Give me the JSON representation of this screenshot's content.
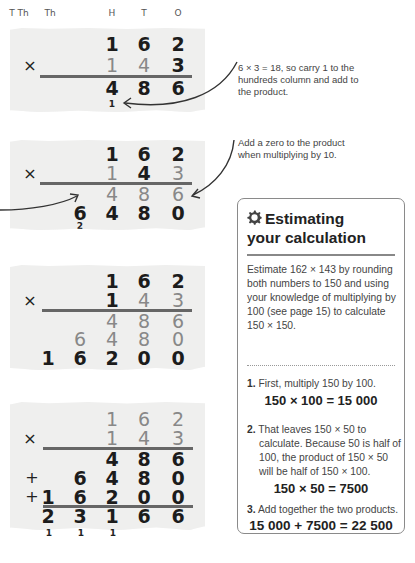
{
  "column_headers": [
    "T Th",
    "Th",
    "H",
    "T",
    "O"
  ],
  "panel1": {
    "rows": [
      {
        "sym": "",
        "digits": [
          "",
          "",
          "1",
          "6",
          "2"
        ]
      },
      {
        "sym": "×",
        "digits": [
          "",
          "",
          "1",
          "4",
          "3"
        ]
      },
      {
        "sym": "",
        "digits": [
          "",
          "",
          "4",
          "8",
          "6"
        ]
      }
    ],
    "carry": "1",
    "note": "6 × 3 = 18, so carry 1 to the hundreds column and add to the product."
  },
  "panel2": {
    "rows": [
      {
        "sym": "",
        "digits": [
          "",
          "",
          "1",
          "6",
          "2"
        ]
      },
      {
        "sym": "×",
        "digits": [
          "",
          "",
          "1",
          "4",
          "3"
        ]
      },
      {
        "sym": "",
        "digits": [
          "",
          "",
          "4",
          "8",
          "6"
        ]
      },
      {
        "sym": "",
        "digits": [
          "",
          "6",
          "4",
          "8",
          "0"
        ]
      }
    ],
    "carry": "2",
    "note": "Add a zero to the product when multiplying by 10."
  },
  "panel3": {
    "rows": [
      {
        "sym": "",
        "digits": [
          "",
          "",
          "1",
          "6",
          "2"
        ]
      },
      {
        "sym": "×",
        "digits": [
          "",
          "",
          "1",
          "4",
          "3"
        ]
      },
      {
        "sym": "",
        "digits": [
          "",
          "",
          "4",
          "8",
          "6"
        ]
      },
      {
        "sym": "",
        "digits": [
          "",
          "6",
          "4",
          "8",
          "0"
        ]
      },
      {
        "sym": "",
        "digits": [
          "1",
          "6",
          "2",
          "0",
          "0"
        ]
      }
    ]
  },
  "panel4": {
    "rows": [
      {
        "sym": "",
        "digits": [
          "",
          "",
          "1",
          "6",
          "2"
        ]
      },
      {
        "sym": "×",
        "digits": [
          "",
          "",
          "1",
          "4",
          "3"
        ]
      },
      {
        "sym": "",
        "digits": [
          "",
          "",
          "4",
          "8",
          "6"
        ]
      },
      {
        "sym": "+",
        "digits": [
          "",
          "6",
          "4",
          "8",
          "0"
        ]
      },
      {
        "sym": "+",
        "digits": [
          "1",
          "6",
          "2",
          "0",
          "0"
        ]
      },
      {
        "sym": "",
        "digits": [
          "2",
          "3",
          "1",
          "6",
          "6"
        ]
      }
    ],
    "carries": [
      "1",
      "1",
      "1"
    ]
  },
  "estimate_box": {
    "title_line1": "Estimating",
    "title_line2": "your calculation",
    "icon": "gear-icon",
    "intro": "Estimate 162 × 143 by rounding both numbers to 150 and using your knowledge of multiplying by 100 (see page 15) to calculate 150 × 150.",
    "steps": [
      {
        "num": "1.",
        "text": "First, multiply 150 by 100.",
        "equation": "150 × 100 = 15 000"
      },
      {
        "num": "2.",
        "text": "That leaves 150 × 50 to calculate. Because 50 is half of 100, the product of 150 × 50 will be half of 150 × 100.",
        "equation": "150 × 50 = 7500"
      },
      {
        "num": "3.",
        "text": "Add together the two products.",
        "equation": "15 000 + 7500 = 22 500"
      }
    ]
  }
}
